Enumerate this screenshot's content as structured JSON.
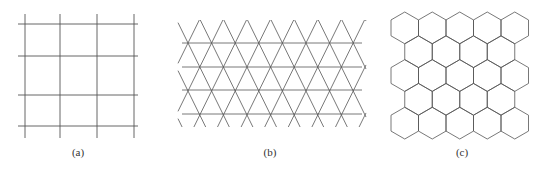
{
  "figure": {
    "panels": [
      {
        "id": "a",
        "label": "(a)",
        "type": "square-grid",
        "rows": 4,
        "cols": 4,
        "x_lines": [
          25,
          60,
          97,
          134
        ],
        "y_lines": [
          24,
          56,
          95,
          126
        ],
        "x_extent": [
          18,
          138
        ],
        "y_extent": [
          14,
          138
        ],
        "label_x": 78
      },
      {
        "id": "b",
        "label": "(b)",
        "type": "triangular-grid",
        "y_lines": [
          43,
          67,
          90,
          114
        ],
        "x_extent": [
          182,
          362
        ],
        "vertex_spacing": 23.6,
        "x0": 188,
        "y_top": 20,
        "y_bottom": 127,
        "label_x": 270
      },
      {
        "id": "c",
        "label": "(c)",
        "type": "hexagonal-grid",
        "rows": 5,
        "cols": 5,
        "x0": 391,
        "y0": 12,
        "hex_width": 27.5,
        "label_x": 462
      }
    ],
    "line_color": "#555555"
  }
}
